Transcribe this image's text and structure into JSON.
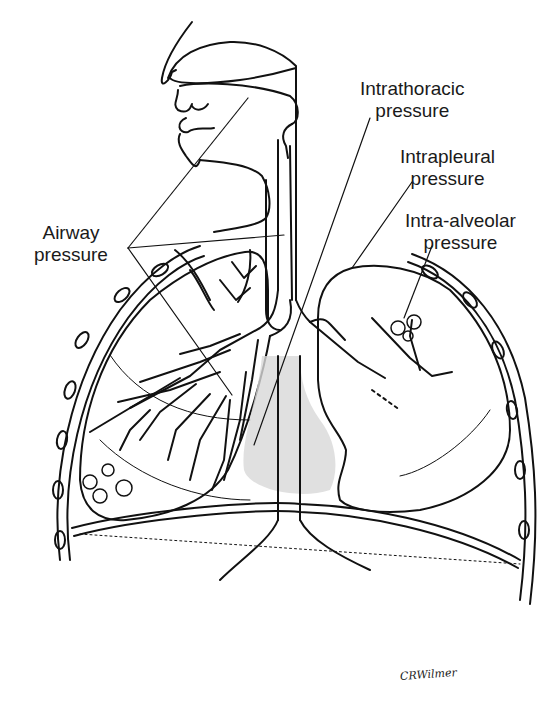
{
  "figure": {
    "type": "anatomical line drawing",
    "stroke_color": "#111111",
    "background": "#ffffff"
  },
  "labels": {
    "intrathoracic": {
      "line1": "Intrathoracic",
      "line2": "pressure"
    },
    "intrapleural": {
      "line1": "Intrapleural",
      "line2": "pressure"
    },
    "intra_alveolar": {
      "line1": "Intra-alveolar",
      "line2": "pressure"
    },
    "airway": {
      "line1": "Airway",
      "line2": "pressure"
    }
  },
  "signature": "CRWilmer"
}
